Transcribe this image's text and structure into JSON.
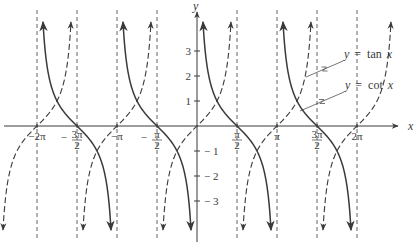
{
  "chart_data": {
    "type": "line",
    "title": "",
    "xlabel": "x",
    "ylabel": "y",
    "xlim_pi": [
      -2.45,
      2.45
    ],
    "ylim": [
      -4.5,
      4.5
    ],
    "grid": false,
    "x_ticks": [
      {
        "value_pi": -2,
        "label": "−2π"
      },
      {
        "value_pi": -1.5,
        "label": "−3π/2",
        "num": "3π",
        "den": "2",
        "sign": "−"
      },
      {
        "value_pi": -1,
        "label": "−π"
      },
      {
        "value_pi": -0.5,
        "label": "−π/2",
        "num": "π",
        "den": "2",
        "sign": "−"
      },
      {
        "value_pi": 0.5,
        "label": "π/2",
        "num": "π",
        "den": "2",
        "sign": ""
      },
      {
        "value_pi": 1,
        "label": "π"
      },
      {
        "value_pi": 1.5,
        "label": "3π/2",
        "num": "3π",
        "den": "2",
        "sign": ""
      },
      {
        "value_pi": 2,
        "label": "2π"
      }
    ],
    "y_ticks": [
      {
        "value": 3,
        "label": "3"
      },
      {
        "value": 2,
        "label": "2"
      },
      {
        "value": 1,
        "label": "1"
      },
      {
        "value": -1,
        "label": "− 1"
      },
      {
        "value": -2,
        "label": "− 2"
      },
      {
        "value": -3,
        "label": "− 3"
      }
    ],
    "asymptotes_pi": [
      -2,
      -1.5,
      -1,
      -0.5,
      0.5,
      1,
      1.5,
      2
    ],
    "series": [
      {
        "name": "y = tan x",
        "function": "tan",
        "style": "dashed",
        "asymptotes_pi": [
          -2.5,
          -1.5,
          -0.5,
          0.5,
          1.5,
          2.5
        ],
        "zeros_pi": [
          -2,
          -1,
          0,
          1,
          2
        ],
        "sample_points": [
          [
            -0.25,
            1
          ],
          [
            0,
            0
          ],
          [
            0.25,
            -1
          ]
        ]
      },
      {
        "name": "y = cot x",
        "function": "cot",
        "style": "solid",
        "asymptotes_pi": [
          -2,
          -1,
          0,
          1,
          2
        ],
        "zeros_pi": [
          -1.5,
          -0.5,
          0.5,
          1.5
        ],
        "sample_points": [
          [
            0.25,
            1
          ],
          [
            0.5,
            0
          ],
          [
            0.75,
            -1
          ]
        ]
      }
    ],
    "legend": [
      {
        "label": "y = tan x",
        "prefix": "y",
        "eq": "=",
        "fn": "tan",
        "var": "x",
        "points_to": "dashed curve"
      },
      {
        "label": "y = cot x",
        "prefix": "y",
        "eq": "=",
        "fn": "cot",
        "var": "x",
        "points_to": "solid curve"
      }
    ],
    "legend_position": "upper right, inline with leader lines"
  },
  "colors": {
    "ink": "#3a3a3a",
    "background": "#ffffff"
  }
}
